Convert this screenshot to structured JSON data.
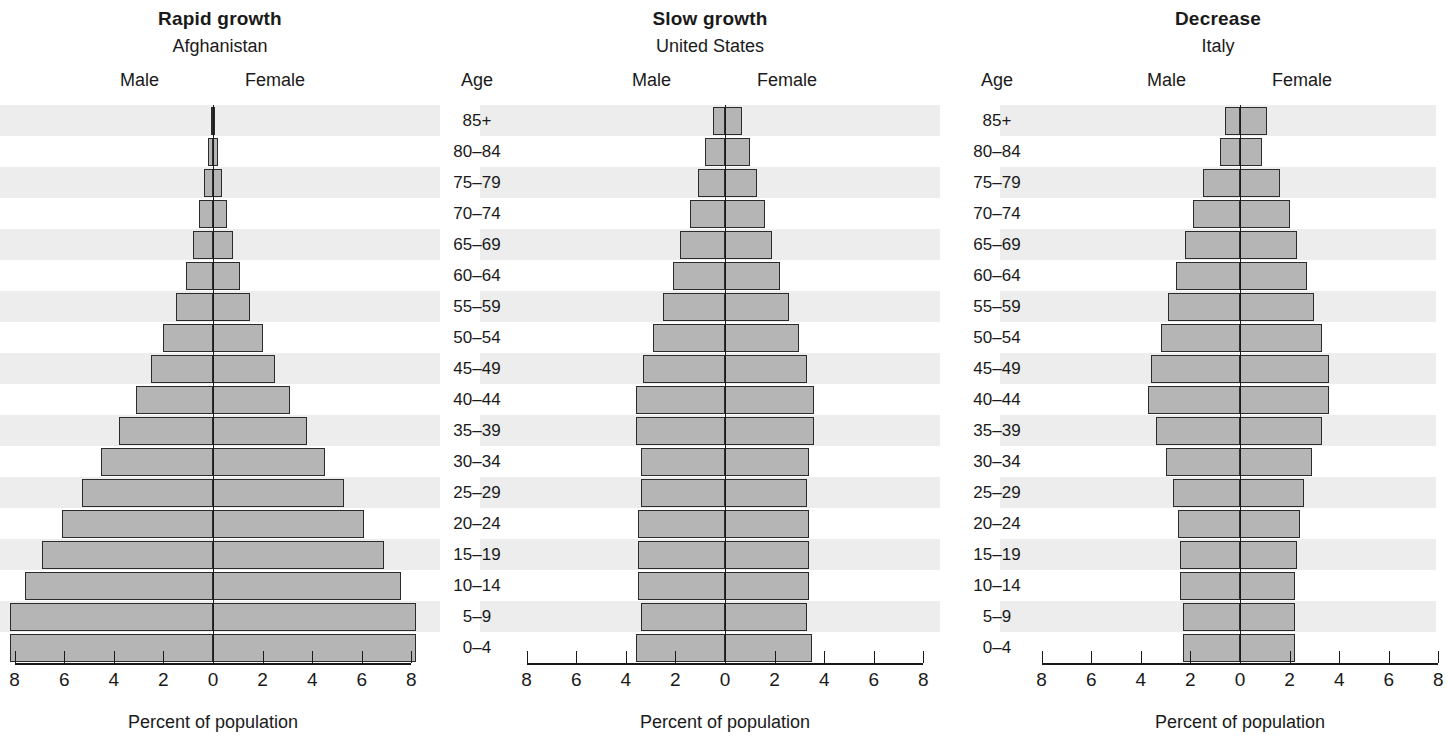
{
  "chart_data": {
    "type": "bar",
    "xlabel": "Percent of population",
    "ylabel": "Age",
    "xlim": [
      -8,
      8
    ],
    "xticks": [
      8,
      6,
      4,
      2,
      0,
      2,
      4,
      6,
      8
    ],
    "grid": false,
    "legend_position": "above-axis",
    "categories": [
      "85+",
      "80–84",
      "75–79",
      "70–74",
      "65–69",
      "60–64",
      "55–59",
      "50–54",
      "45–49",
      "40–44",
      "35–39",
      "30–34",
      "25–29",
      "20–24",
      "15–19",
      "10–14",
      "5–9",
      "0–4"
    ],
    "panels": [
      {
        "title": "Rapid growth",
        "country": "Afghanistan",
        "male_label": "Male",
        "female_label": "Female",
        "age_header": "Age",
        "xlabel": "Percent of population",
        "series": [
          {
            "name": "Male",
            "values": [
              0.05,
              0.2,
              0.35,
              0.55,
              0.8,
              1.1,
              1.5,
              2.0,
              2.5,
              3.1,
              3.8,
              4.5,
              5.3,
              6.1,
              6.9,
              7.6,
              8.2,
              8.2
            ]
          },
          {
            "name": "Female",
            "values": [
              0.05,
              0.2,
              0.35,
              0.55,
              0.8,
              1.1,
              1.5,
              2.0,
              2.5,
              3.1,
              3.8,
              4.5,
              5.3,
              6.1,
              6.9,
              7.6,
              8.2,
              8.2
            ]
          }
        ]
      },
      {
        "title": "Slow growth",
        "country": "United States",
        "male_label": "Male",
        "female_label": "Female",
        "age_header": "Age",
        "xlabel": "Percent of population",
        "series": [
          {
            "name": "Male",
            "values": [
              0.5,
              0.8,
              1.1,
              1.4,
              1.8,
              2.1,
              2.5,
              2.9,
              3.3,
              3.6,
              3.6,
              3.4,
              3.4,
              3.5,
              3.5,
              3.5,
              3.4,
              3.6
            ]
          },
          {
            "name": "Female",
            "values": [
              0.7,
              1.0,
              1.3,
              1.6,
              1.9,
              2.2,
              2.6,
              3.0,
              3.3,
              3.6,
              3.6,
              3.4,
              3.3,
              3.4,
              3.4,
              3.4,
              3.3,
              3.5
            ]
          }
        ]
      },
      {
        "title": "Decrease",
        "country": "Italy",
        "male_label": "Male",
        "female_label": "Female",
        "age_header": "Age",
        "xlabel": "Percent of population",
        "series": [
          {
            "name": "Male",
            "values": [
              0.6,
              0.8,
              1.5,
              1.9,
              2.2,
              2.6,
              2.9,
              3.2,
              3.6,
              3.7,
              3.4,
              3.0,
              2.7,
              2.5,
              2.4,
              2.4,
              2.3,
              2.3
            ]
          },
          {
            "name": "Female",
            "values": [
              1.1,
              0.9,
              1.6,
              2.0,
              2.3,
              2.7,
              3.0,
              3.3,
              3.6,
              3.6,
              3.3,
              2.9,
              2.6,
              2.4,
              2.3,
              2.2,
              2.2,
              2.2
            ]
          }
        ]
      }
    ]
  }
}
